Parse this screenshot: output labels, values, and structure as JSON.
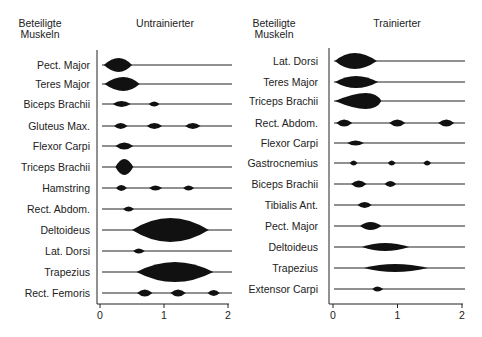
{
  "chart_data": [
    {
      "type": "table",
      "subtype": "activity-timeline",
      "title": "Untrainierter",
      "column_header": [
        "Beteiligte",
        "Muskeln"
      ],
      "xlabel": "",
      "x_ticks": [
        "0",
        "1",
        "2"
      ],
      "xlim": [
        0,
        2
      ],
      "grid": false,
      "rows": [
        {
          "muscle": "Pect. Major",
          "bursts": [
            {
              "start": 0.06,
              "end": 0.5,
              "peak": 0.3,
              "amp": 7
            }
          ]
        },
        {
          "muscle": "Teres Major",
          "bursts": [
            {
              "start": 0.07,
              "end": 0.62,
              "peak": 0.38,
              "amp": 7
            }
          ]
        },
        {
          "muscle": "Biceps Brachii",
          "bursts": [
            {
              "start": 0.2,
              "end": 0.48,
              "peak": 0.33,
              "amp": 3
            },
            {
              "start": 0.76,
              "end": 0.93,
              "peak": 0.85,
              "amp": 2.5
            }
          ]
        },
        {
          "muscle": "Gluteus Max.",
          "bursts": [
            {
              "start": 0.22,
              "end": 0.43,
              "peak": 0.32,
              "amp": 3
            },
            {
              "start": 0.73,
              "end": 0.97,
              "peak": 0.85,
              "amp": 3
            },
            {
              "start": 1.33,
              "end": 1.57,
              "peak": 1.45,
              "amp": 3
            }
          ]
        },
        {
          "muscle": "Flexor Carpi",
          "bursts": [
            {
              "start": 0.24,
              "end": 0.52,
              "peak": 0.38,
              "amp": 3.5
            }
          ]
        },
        {
          "muscle": "Triceps Brachii",
          "bursts": [
            {
              "start": 0.24,
              "end": 0.52,
              "peak": 0.38,
              "amp": 8
            }
          ]
        },
        {
          "muscle": "Hamstring",
          "bursts": [
            {
              "start": 0.25,
              "end": 0.42,
              "peak": 0.33,
              "amp": 3
            },
            {
              "start": 0.77,
              "end": 0.97,
              "peak": 0.86,
              "amp": 2.5
            },
            {
              "start": 1.3,
              "end": 1.47,
              "peak": 1.38,
              "amp": 2.5
            }
          ]
        },
        {
          "muscle": "Rect. Abdom.",
          "bursts": [
            {
              "start": 0.36,
              "end": 0.53,
              "peak": 0.45,
              "amp": 2.5
            }
          ]
        },
        {
          "muscle": "Deltoideus",
          "bursts": [
            {
              "start": 0.5,
              "end": 1.7,
              "peak": 1.1,
              "amp": 12
            }
          ]
        },
        {
          "muscle": "Lat. Dorsi",
          "bursts": [
            {
              "start": 0.52,
              "end": 0.7,
              "peak": 0.6,
              "amp": 2.5
            }
          ]
        },
        {
          "muscle": "Trapezius",
          "bursts": [
            {
              "start": 0.57,
              "end": 1.77,
              "peak": 1.17,
              "amp": 10
            }
          ]
        },
        {
          "muscle": "Rect. Femoris",
          "bursts": [
            {
              "start": 0.58,
              "end": 0.82,
              "peak": 0.7,
              "amp": 3.5
            },
            {
              "start": 1.1,
              "end": 1.34,
              "peak": 1.22,
              "amp": 3.5
            },
            {
              "start": 1.68,
              "end": 1.87,
              "peak": 1.78,
              "amp": 3
            }
          ]
        }
      ]
    },
    {
      "type": "table",
      "subtype": "activity-timeline",
      "title": "Trainierter",
      "column_header": [
        "Beteiligte",
        "Muskeln"
      ],
      "xlabel": "",
      "x_ticks": [
        "0",
        "1",
        "2"
      ],
      "xlim": [
        0,
        2
      ],
      "grid": false,
      "rows": [
        {
          "muscle": "Lat. Dorsi",
          "bursts": [
            {
              "start": 0.03,
              "end": 0.68,
              "peak": 0.32,
              "amp": 8
            }
          ]
        },
        {
          "muscle": "Teres Major",
          "bursts": [
            {
              "start": 0.03,
              "end": 0.7,
              "peak": 0.35,
              "amp": 6
            }
          ]
        },
        {
          "muscle": "Triceps Brachii",
          "bursts": [
            {
              "start": 0.03,
              "end": 0.75,
              "peak": 0.62,
              "amp": 8
            }
          ]
        },
        {
          "muscle": "Rect. Abdom.",
          "bursts": [
            {
              "start": 0.05,
              "end": 0.3,
              "peak": 0.17,
              "amp": 3.5
            },
            {
              "start": 0.87,
              "end": 1.12,
              "peak": 1.0,
              "amp": 3.5
            },
            {
              "start": 1.63,
              "end": 1.88,
              "peak": 1.76,
              "amp": 3.5
            }
          ]
        },
        {
          "muscle": "Flexor Carpi",
          "bursts": [
            {
              "start": 0.22,
              "end": 0.48,
              "peak": 0.35,
              "amp": 2.5
            }
          ]
        },
        {
          "muscle": "Gastrocnemius",
          "bursts": [
            {
              "start": 0.26,
              "end": 0.38,
              "peak": 0.32,
              "amp": 2.5
            },
            {
              "start": 0.85,
              "end": 0.97,
              "peak": 0.91,
              "amp": 2.5
            },
            {
              "start": 1.4,
              "end": 1.52,
              "peak": 1.46,
              "amp": 2.5
            }
          ]
        },
        {
          "muscle": "Biceps Brachii",
          "bursts": [
            {
              "start": 0.28,
              "end": 0.52,
              "peak": 0.4,
              "amp": 3.5
            },
            {
              "start": 0.8,
              "end": 0.98,
              "peak": 0.89,
              "amp": 3
            }
          ]
        },
        {
          "muscle": "Tibialis Ant.",
          "bursts": [
            {
              "start": 0.38,
              "end": 0.6,
              "peak": 0.49,
              "amp": 3
            }
          ]
        },
        {
          "muscle": "Pect. Major",
          "bursts": [
            {
              "start": 0.42,
              "end": 0.75,
              "peak": 0.58,
              "amp": 4
            }
          ]
        },
        {
          "muscle": "Deltoideus",
          "bursts": [
            {
              "start": 0.45,
              "end": 1.18,
              "peak": 0.8,
              "amp": 4
            }
          ]
        },
        {
          "muscle": "Trapezius",
          "bursts": [
            {
              "start": 0.48,
              "end": 1.47,
              "peak": 0.95,
              "amp": 4
            }
          ]
        },
        {
          "muscle": "Extensor Carpi",
          "bursts": [
            {
              "start": 0.61,
              "end": 0.78,
              "peak": 0.68,
              "amp": 2.5
            }
          ]
        }
      ]
    }
  ]
}
